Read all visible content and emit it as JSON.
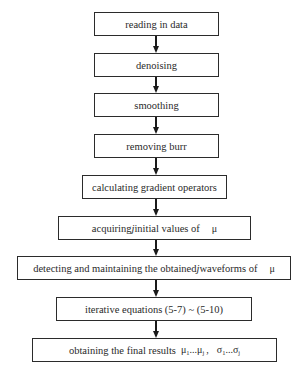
{
  "diagram": {
    "type": "flowchart",
    "direction": "top-to-bottom",
    "steps": [
      {
        "id": 1,
        "label": "reading in data"
      },
      {
        "id": 2,
        "label": "denoising"
      },
      {
        "id": 3,
        "label": "smoothing"
      },
      {
        "id": 4,
        "label": "removing burr"
      },
      {
        "id": 5,
        "label": "calculating gradient operators"
      },
      {
        "id": 6,
        "label_pre": "acquiring ",
        "label_var": "j",
        "label_post": " initial values of",
        "symbol": "μ"
      },
      {
        "id": 7,
        "label_pre": "detecting and maintaining the obtained ",
        "label_var": "j",
        "label_post": " waveforms of",
        "symbol": "μ"
      },
      {
        "id": 8,
        "label": "iterative equations (5-7) ~ (5-10)"
      },
      {
        "id": 9,
        "label": "obtaining the final results",
        "mu_first": "μ",
        "mu_first_sub": "1",
        "mu_dots": "...",
        "mu_last": "μ",
        "mu_last_sub": "j",
        "sep": ",",
        "sigma_first": "σ",
        "sigma_first_sub": "1",
        "sigma_dots": "...",
        "sigma_last": "σ",
        "sigma_last_sub": "j"
      }
    ],
    "edges": [
      {
        "from": 1,
        "to": 2
      },
      {
        "from": 2,
        "to": 3
      },
      {
        "from": 3,
        "to": 4
      },
      {
        "from": 4,
        "to": 5
      },
      {
        "from": 5,
        "to": 6
      },
      {
        "from": 6,
        "to": 7
      },
      {
        "from": 7,
        "to": 8
      },
      {
        "from": 8,
        "to": 9
      }
    ]
  },
  "colors": {
    "background": "#ffffff",
    "stroke": "#2b2b2b",
    "text": "#2a2a2a"
  }
}
